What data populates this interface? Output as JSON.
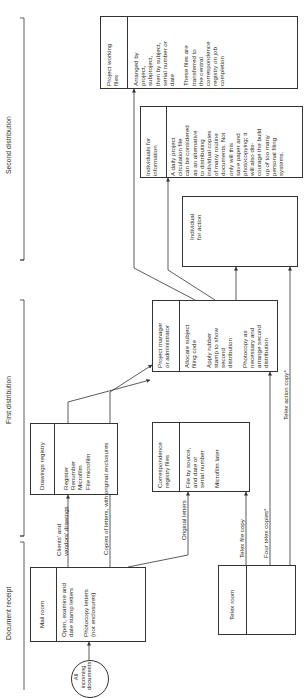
{
  "stages": {
    "document_receipt": "Document receipt",
    "first_distribution": "First distribution",
    "second_distribution": "Second distribution"
  },
  "start": {
    "label": "All\nincoming\ndocuments"
  },
  "boxes": {
    "mail_room": {
      "title": "Mail room",
      "body": "Open, examine and\ndate stamp letters\n\nPhotocopy letters\n(not enclosures)"
    },
    "drawings_registry": {
      "title": "Drawings registry",
      "body": "Register\nRenumber\nMicrofilm\nFile microfilm"
    },
    "telex_room": {
      "title": "Telex room",
      "body": ""
    },
    "correspondence_registry": {
      "title": "Correspondence\nregistry files",
      "body": "File by source,\nand date or\nserial number\n\nMicrofilm later"
    },
    "project_manager": {
      "title": "Project manager\nor administrator",
      "body": "Allocate subject\nfiling code\n\nApply rubber\nstamp to show\nsecond\ndistribution\n\nPhotocopy as\nnecessary and\narrange second\ndistribution"
    },
    "individual_action": {
      "title": "Individual\nfor action"
    },
    "individuals_information": {
      "title": "Individuals for\ninformation",
      "body": "A daily project\ncirculation file\ncan be considered\nas an alternative\nto distributing\nindividual copies\nof many routine\ndocuments. Not\nonly will this\nsave paper and\nphotocopying; it\nwill also dis-\ncourage the build\nup of too many\npersonal filing\nsystems."
    },
    "project_working_files": {
      "title": "Project working\nfiles",
      "body": "Arranged by\nproject,\nsubproject,\nthen by subject,\nserial number or\ndate\n\nThese files are\ntransferred to\nthe central\ncorrespondence\nregistry on job\ncompletion"
    }
  },
  "flows": {
    "clients_drawings": "Clients' and\nvendors' drawings",
    "copies_letters": "Copies of letters, with original enclosures",
    "original_letters": "Original letters",
    "telex_file_copy": "Telex file copy",
    "four_telex_copies": "Four telex copies*",
    "telex_action_copy": "Telex action copy*"
  },
  "colors": {
    "line": "#333333",
    "text": "#2a2a2a",
    "background": "#ffffff"
  }
}
